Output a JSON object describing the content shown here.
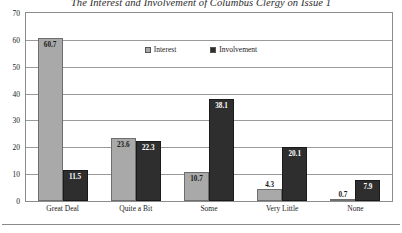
{
  "chart_data": {
    "type": "bar",
    "title": "The Interest and Involvement of Columbus Clergy on Issue 1",
    "xlabel": "",
    "ylabel": "",
    "ylim": [
      0,
      70
    ],
    "yticks": [
      0,
      10,
      20,
      30,
      40,
      50,
      60,
      70
    ],
    "grid": true,
    "legend_position": "top-center",
    "categories": [
      "Great Deal",
      "Quite a Bit",
      "Some",
      "Very Little",
      "None"
    ],
    "series": [
      {
        "name": "Interest",
        "color": "#a9a9a9",
        "values": [
          60.7,
          23.6,
          10.7,
          4.3,
          0.7
        ]
      },
      {
        "name": "Involvement",
        "color": "#2e2e2e",
        "values": [
          11.5,
          22.3,
          38.1,
          20.1,
          7.9
        ]
      }
    ],
    "data_labels": [
      [
        "60.7",
        "23.6",
        "10.7",
        "4.3",
        "0.7"
      ],
      [
        "11.5",
        "22.3",
        "38.1",
        "20.1",
        "7.9"
      ]
    ]
  },
  "axis": {
    "y_tick_labels": [
      "70",
      "60",
      "50",
      "40",
      "30",
      "20",
      "10",
      "0"
    ],
    "x_tick_labels": [
      "Great Deal",
      "Quite a Bit",
      "Some",
      "Very Little",
      "None"
    ]
  },
  "legend": {
    "items": [
      {
        "label": "Interest"
      },
      {
        "label": "Involvement"
      }
    ]
  }
}
